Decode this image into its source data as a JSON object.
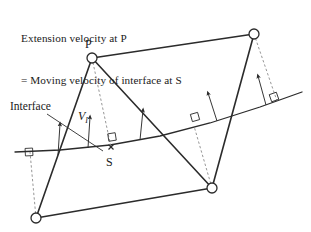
{
  "figure": {
    "caption_line1": "Extension velocity at P",
    "caption_line2": "= Moving velocity of interface at S",
    "labels": {
      "point_p": "P",
      "point_s": "S",
      "velocity": "V",
      "velocity_subscript": "I",
      "interface": "Interface"
    },
    "colors": {
      "stroke": "#2b2b2b",
      "dashed_stroke": "#8a8a8a",
      "text": "#1a1a1a",
      "background": "#ffffff",
      "node_fill": "#ffffff"
    },
    "geometry": {
      "nodes": [
        {
          "name": "node-p",
          "x": 92,
          "y": 58,
          "r": 5
        },
        {
          "name": "node-top-right",
          "x": 254,
          "y": 34,
          "r": 5
        },
        {
          "name": "node-bottom-right",
          "x": 212,
          "y": 188,
          "r": 5
        },
        {
          "name": "node-bottom-left",
          "x": 36,
          "y": 218,
          "r": 5
        }
      ],
      "interface_path": "M 15 152 L 60 150 L 110 145 L 160 136 L 210 123 L 260 107 L 302 92",
      "solid_edges": [
        {
          "name": "edge-p-topright",
          "x1": 92,
          "y1": 58,
          "x2": 254,
          "y2": 34
        },
        {
          "name": "edge-p-bottomleft",
          "x1": 92,
          "y1": 58,
          "x2": 36,
          "y2": 218
        },
        {
          "name": "edge-p-bottomright",
          "x1": 92,
          "y1": 58,
          "x2": 212,
          "y2": 188
        },
        {
          "name": "edge-topright-bottomright",
          "x1": 254,
          "y1": 34,
          "x2": 212,
          "y2": 188
        },
        {
          "name": "edge-bottomleft-bottomright",
          "x1": 36,
          "y1": 218,
          "x2": 212,
          "y2": 188
        }
      ],
      "dashed_normals": [
        {
          "name": "normal-p-to-s",
          "x1": 92,
          "y1": 58,
          "x2": 111,
          "y2": 147
        },
        {
          "name": "normal-topright-to-interface",
          "x1": 254,
          "y1": 34,
          "x2": 277,
          "y2": 101
        },
        {
          "name": "normal-bottomright-to-interface",
          "x1": 212,
          "y1": 188,
          "x2": 194,
          "y2": 126
        },
        {
          "name": "normal-bottomleft-to-interface",
          "x1": 36,
          "y1": 218,
          "x2": 30,
          "y2": 152
        }
      ],
      "right_angle_markers": [
        {
          "name": "right-angle-at-s",
          "x": 112,
          "y": 137,
          "angle": -9
        },
        {
          "name": "right-angle-left",
          "x": 29,
          "y": 152,
          "angle": -3
        },
        {
          "name": "right-angle-mid-right",
          "x": 195,
          "y": 117,
          "angle": -16
        },
        {
          "name": "right-angle-far-right",
          "x": 274,
          "y": 97,
          "angle": -19
        }
      ],
      "velocity_arrows": [
        {
          "name": "velocity-arrow-1",
          "x1": 58,
          "y1": 155,
          "x2": 60,
          "y2": 124
        },
        {
          "name": "velocity-arrow-2",
          "x1": 88,
          "y1": 148,
          "x2": 90,
          "y2": 117
        },
        {
          "name": "velocity-arrow-3",
          "x1": 140,
          "y1": 140,
          "x2": 143,
          "y2": 110
        },
        {
          "name": "velocity-arrow-4",
          "x1": 217,
          "y1": 121,
          "x2": 208,
          "y2": 93
        },
        {
          "name": "velocity-arrow-5",
          "x1": 266,
          "y1": 105,
          "x2": 258,
          "y2": 76
        }
      ],
      "interface_leader": {
        "x1": 47,
        "y1": 114,
        "x2": 103,
        "y2": 151
      },
      "s_marker": {
        "x": 111,
        "y": 147,
        "size": 5
      }
    }
  }
}
